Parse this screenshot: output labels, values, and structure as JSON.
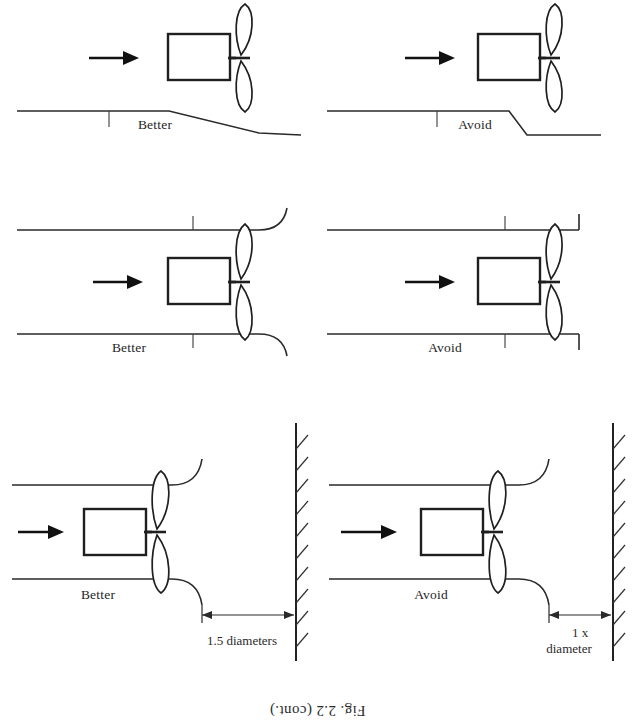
{
  "figure": {
    "caption": "Fig. 2.2 (cont.)",
    "orientation": "upside-down scan (content rotated 180 degrees)",
    "label_avoid": "Avoid",
    "label_better": "Better",
    "flow_arrow_semantic": "air-flow-direction-arrow",
    "ink_color": "#2a2a2a",
    "paper_color": "#ffffff"
  },
  "panels": [
    {
      "id": "top-left",
      "verdict": "Better",
      "dimension_label": "1.5 diameters",
      "description": "Fan in duct set back 1.5 diameters from hatched wall, bell-mouth flared inlet",
      "has_wall": true,
      "inlet": "bell-mouth",
      "wall_label": "hatched-wall"
    },
    {
      "id": "top-right",
      "verdict": "Avoid",
      "dimension_label": "1 x diameter",
      "description": "Fan in duct set back only 1 diameter from hatched wall, bell-mouth inlet",
      "has_wall": true,
      "inlet": "bell-mouth",
      "wall_label": "hatched-wall"
    },
    {
      "id": "middle-left",
      "verdict": "Better",
      "dimension_label": "",
      "description": "Duct inlet with rounded bell-mouth entry upstream of fan",
      "has_wall": false,
      "inlet": "bell-mouth"
    },
    {
      "id": "middle-right",
      "verdict": "Avoid",
      "dimension_label": "",
      "description": "Duct inlet with sharp square-edged entry upstream of fan",
      "has_wall": false,
      "inlet": "sharp-square-edge"
    },
    {
      "id": "bottom-left",
      "verdict": "Better",
      "dimension_label": "",
      "description": "Gradual tapered duct transition ahead of fan",
      "has_wall": false,
      "inlet": "gradual-taper"
    },
    {
      "id": "bottom-right",
      "verdict": "Avoid",
      "dimension_label": "",
      "description": "Abrupt stepped duct transition ahead of fan",
      "has_wall": false,
      "inlet": "abrupt-step"
    }
  ],
  "dimension_labels": {
    "one_point_five_diameters": "1.5 diameters",
    "one_diameter_top": "diameter",
    "one_diameter_bottom": "1 x"
  }
}
